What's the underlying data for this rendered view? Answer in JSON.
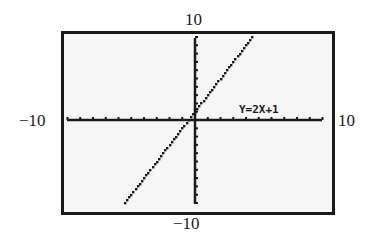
{
  "chart_data": {
    "type": "line",
    "title": "",
    "equation_label": "Y=2X+1",
    "series": [
      {
        "name": "Y=2X+1",
        "slope": 2,
        "intercept": 1,
        "x": [
          -5.5,
          -5,
          -4,
          -3,
          -2,
          -1,
          0,
          1,
          2,
          3,
          4,
          4.5
        ],
        "y": [
          -10,
          -9,
          -7,
          -5,
          -3,
          -1,
          1,
          3,
          5,
          7,
          9,
          10
        ]
      }
    ],
    "xlim": [
      -10,
      10
    ],
    "ylim": [
      -10,
      10
    ],
    "xscale": 1,
    "yscale": 1,
    "xlabel": "",
    "ylabel": "",
    "grid": false,
    "tick_labels": {
      "xmin": "−10",
      "xmax": "10",
      "ymin": "−10",
      "ymax": "10"
    },
    "colors": {
      "frame": "#1a1a1a",
      "screen": "#f6f6f6",
      "ink": "#1a1a1a"
    }
  }
}
